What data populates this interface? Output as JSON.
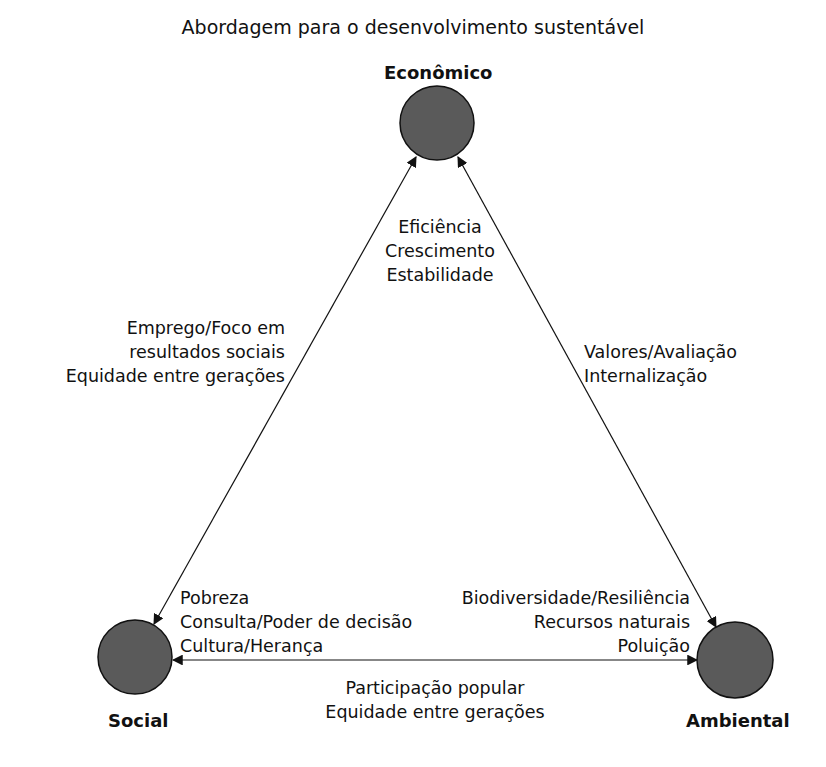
{
  "title": "Abordagem para o desenvolvimento sustentável",
  "nodes": {
    "economic": {
      "label": "Econômico",
      "fill": "#5a5a5a"
    },
    "social": {
      "label": "Social",
      "fill": "#5a5a5a"
    },
    "environmental": {
      "label": "Ambiental",
      "fill": "#5a5a5a"
    }
  },
  "labels": {
    "economic_inner": [
      "Eficiência",
      "Crescimento",
      "Estabilidade"
    ],
    "economic_social_edge": [
      "Emprego/Foco em",
      "resultados sociais",
      "Equidade entre gerações"
    ],
    "economic_environmental_edge": [
      "Valores/Avaliação",
      "Internalização"
    ],
    "social_inner": [
      "Pobreza",
      "Consulta/Poder de decisão",
      "Cultura/Herança"
    ],
    "environmental_inner": [
      "Biodiversidade/Resiliência",
      "Recursos naturais",
      "Poluição"
    ],
    "social_environmental_edge": [
      "Participação popular",
      "Equidade entre gerações"
    ]
  }
}
